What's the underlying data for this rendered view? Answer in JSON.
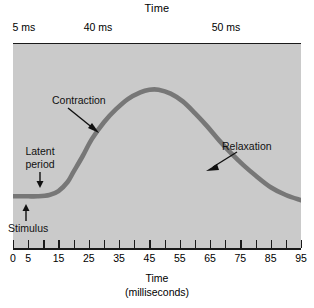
{
  "chart_data": {
    "type": "line",
    "title": "",
    "xlabel": "Time",
    "xlabel_units": "(milliseconds)",
    "ylabel": "",
    "xlim": [
      0,
      95
    ],
    "ylim": [
      0,
      100
    ],
    "grid": false,
    "legend": "none",
    "background_color": "#cacaca",
    "curve_color": "#777777",
    "axis_color": "#1a1a1a",
    "x_ticks": [
      0,
      5,
      10,
      15,
      20,
      25,
      30,
      35,
      40,
      45,
      50,
      55,
      60,
      65,
      70,
      75,
      80,
      85,
      90,
      95
    ],
    "x_tick_labels": [
      "0",
      "5",
      "",
      "15",
      "",
      "25",
      "",
      "35",
      "",
      "45",
      "",
      "55",
      "",
      "65",
      "",
      "75",
      "",
      "85",
      "",
      "95"
    ],
    "series": [
      {
        "name": "Muscle twitch tension",
        "x": [
          0,
          2,
          5,
          8,
          12,
          15,
          18,
          20,
          23,
          26,
          30,
          34,
          38,
          42,
          45,
          48,
          52,
          56,
          60,
          64,
          68,
          72,
          76,
          80,
          85,
          90,
          95
        ],
        "y": [
          9,
          9,
          9,
          9,
          10,
          13,
          20,
          28,
          40,
          53,
          66,
          76,
          84,
          89,
          91,
          91,
          88,
          82,
          73,
          63,
          52,
          42,
          33,
          25,
          16,
          10,
          6
        ]
      }
    ],
    "annotations": [
      {
        "label": "Contraction",
        "points_to_x": 27,
        "points_to_y": 62
      },
      {
        "label": "Relaxation",
        "points_to_x": 67,
        "points_to_y": 52
      },
      {
        "label": "Latent period",
        "points_to_x": 6,
        "points_to_y": 9
      },
      {
        "label": "Stimulus",
        "points_to_x": 3,
        "points_to_y": 9
      }
    ],
    "top_axis": {
      "title": "Time",
      "segments": [
        {
          "label": "5 ms",
          "from_x": 0,
          "to_x": 5
        },
        {
          "label": "40 ms",
          "from_x": 5,
          "to_x": 45
        },
        {
          "label": "50 ms",
          "from_x": 45,
          "to_x": 95
        }
      ],
      "tick_positions_x": [
        0,
        5,
        45,
        95
      ]
    }
  },
  "top_axis": {
    "title": "Time",
    "segment_labels": {
      "first": "5 ms",
      "second": "40 ms",
      "third": "50 ms"
    }
  },
  "annotations": {
    "contraction": "Contraction",
    "relaxation": "Relaxation",
    "latent_line1": "Latent",
    "latent_line2": "period",
    "stimulus": "Stimulus"
  },
  "bottom_axis": {
    "title": "Time",
    "units": "(milliseconds)",
    "labels": [
      "0",
      "5",
      "15",
      "25",
      "35",
      "45",
      "55",
      "65",
      "75",
      "85",
      "95"
    ]
  }
}
